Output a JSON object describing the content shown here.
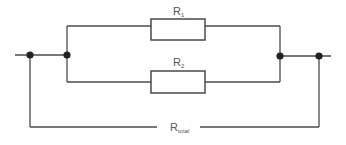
{
  "diagram": {
    "type": "parallel-resistor-circuit",
    "resistors": [
      {
        "id": "R1",
        "symbol": "R",
        "subscript": "1",
        "branch": "top"
      },
      {
        "id": "R2",
        "symbol": "R",
        "subscript": "2",
        "branch": "bottom"
      }
    ],
    "total_label": {
      "symbol": "R",
      "subscript": "total"
    },
    "nodes": [
      "input-terminal-node",
      "left-junction-node",
      "right-junction-node",
      "output-terminal-node"
    ]
  }
}
